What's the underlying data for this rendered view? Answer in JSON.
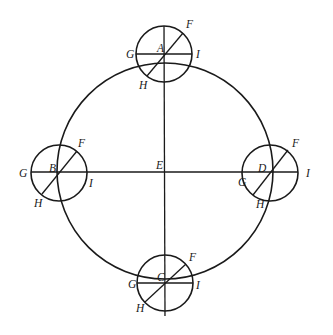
{
  "diagram": {
    "labels": {
      "center": "E",
      "top": {
        "center": "A",
        "F": "F",
        "G": "G",
        "H": "H",
        "I": "I"
      },
      "left": {
        "center": "B",
        "F": "F",
        "G": "G",
        "H": "H",
        "I": "I"
      },
      "right": {
        "center": "D",
        "F": "F",
        "G": "G",
        "H": "H",
        "I": "I"
      },
      "bottom": {
        "center": "C",
        "F": "F",
        "G": "G",
        "H": "H",
        "I": "I"
      }
    },
    "colors": {
      "line": "#1a1a1a",
      "background": "#ffffff"
    }
  }
}
